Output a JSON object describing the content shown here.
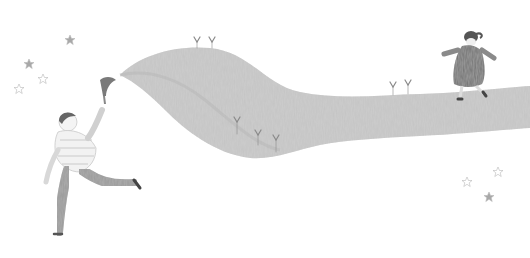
{
  "scene": {
    "description": "Pencil illustration: a running child holds a flowing wavy ribbon of land that stretches across the page to a girl walking on it; sprouts grow on the ribbon, stars scattered on both sides",
    "colors": {
      "background": "#ffffff",
      "ribbon": "#c9c9c9",
      "ribbon_dark": "#a8a8a8",
      "figure_dark": "#6e6e6e",
      "star": "#a0a0a0",
      "sprout": "#8a8a8a"
    },
    "stars_left": [
      [
        70,
        40
      ],
      [
        29,
        64
      ],
      [
        43,
        79
      ],
      [
        19,
        89
      ]
    ],
    "stars_right": [
      [
        498,
        172
      ],
      [
        467,
        182
      ],
      [
        489,
        197
      ]
    ],
    "sprouts": [
      [
        197,
        40
      ],
      [
        212,
        40
      ],
      [
        237,
        120
      ],
      [
        258,
        133
      ],
      [
        276,
        138
      ],
      [
        393,
        85
      ],
      [
        408,
        83
      ]
    ]
  }
}
